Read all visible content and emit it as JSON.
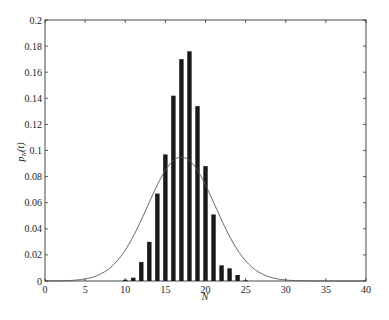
{
  "chart_data": {
    "type": "bar",
    "title": "",
    "xlabel": "N",
    "ylabel": "p_N(t)",
    "xlim": [
      0,
      40
    ],
    "ylim": [
      0,
      0.2
    ],
    "xticks": [
      0,
      5,
      10,
      15,
      20,
      25,
      30,
      35,
      40
    ],
    "yticks": [
      0,
      0.02,
      0.04,
      0.06,
      0.08,
      0.1,
      0.12,
      0.14,
      0.16,
      0.18,
      0.2
    ],
    "grid": false,
    "legend": null,
    "categories": [
      10,
      11,
      12,
      13,
      14,
      15,
      16,
      17,
      18,
      19,
      20,
      21,
      22,
      23,
      24,
      25
    ],
    "series": [
      {
        "name": "histogram",
        "type": "bar",
        "values": [
          0.001,
          0.0025,
          0.0145,
          0.03,
          0.067,
          0.097,
          0.142,
          0.17,
          0.176,
          0.134,
          0.088,
          0.051,
          0.012,
          0.0097,
          0.0046,
          0.0005
        ]
      },
      {
        "name": "gaussian fit",
        "type": "line",
        "mean": 17,
        "std": 4.2,
        "peak": 0.095
      }
    ]
  }
}
